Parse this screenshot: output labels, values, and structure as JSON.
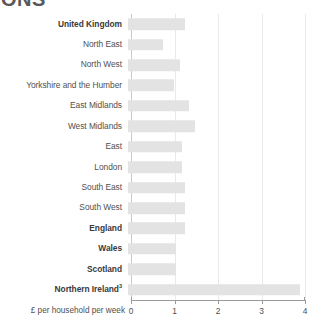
{
  "masthead": {
    "text": "ONS"
  },
  "chart_data": {
    "type": "bar",
    "orientation": "horizontal",
    "title": "",
    "subtitle": "",
    "xlabel": "£ per household per week",
    "ylabel": "",
    "xlim": [
      0,
      4
    ],
    "xticks": [
      0,
      1,
      2,
      3,
      4
    ],
    "xtick_labels": [
      "0",
      "1",
      "2",
      "3",
      "4"
    ],
    "grid": true,
    "legend": false,
    "bar_color": "#e3e3e3",
    "categories": [
      "United Kingdom",
      "North East",
      "North West",
      "Yorkshire and the Humber",
      "East Midlands",
      "West Midlands",
      "East",
      "London",
      "South East",
      "South West",
      "England",
      "Wales",
      "Scotland",
      "Northern Ireland"
    ],
    "values": [
      1.3,
      0.8,
      1.2,
      1.05,
      1.4,
      1.55,
      1.25,
      1.25,
      1.3,
      1.3,
      1.3,
      1.1,
      1.1,
      3.95
    ],
    "bars": [
      {
        "label": "United Kingdom",
        "value": 1.3,
        "bold": true,
        "footnote": ""
      },
      {
        "label": "North East",
        "value": 0.8,
        "bold": false,
        "footnote": ""
      },
      {
        "label": "North West",
        "value": 1.2,
        "bold": false,
        "footnote": ""
      },
      {
        "label": "Yorkshire and the Humber",
        "value": 1.05,
        "bold": false,
        "footnote": ""
      },
      {
        "label": "East Midlands",
        "value": 1.4,
        "bold": false,
        "footnote": ""
      },
      {
        "label": "West Midlands",
        "value": 1.55,
        "bold": false,
        "footnote": ""
      },
      {
        "label": "East",
        "value": 1.25,
        "bold": false,
        "footnote": ""
      },
      {
        "label": "London",
        "value": 1.25,
        "bold": false,
        "footnote": ""
      },
      {
        "label": "South East",
        "value": 1.3,
        "bold": false,
        "footnote": ""
      },
      {
        "label": "South West",
        "value": 1.3,
        "bold": false,
        "footnote": ""
      },
      {
        "label": "England",
        "value": 1.3,
        "bold": true,
        "footnote": ""
      },
      {
        "label": "Wales",
        "value": 1.1,
        "bold": true,
        "footnote": ""
      },
      {
        "label": "Scotland",
        "value": 1.1,
        "bold": true,
        "footnote": ""
      },
      {
        "label": "Northern Ireland",
        "value": 3.95,
        "bold": true,
        "footnote": "3"
      }
    ]
  }
}
